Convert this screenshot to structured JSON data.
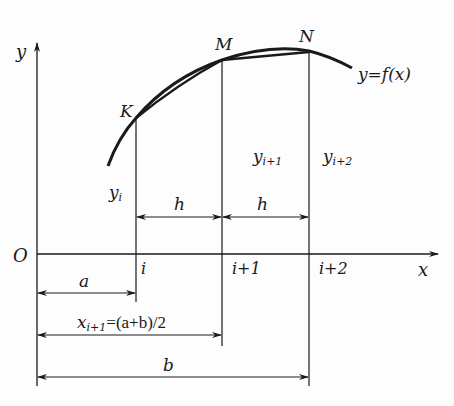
{
  "diagram": {
    "type": "numerical-integration-simpson-illustration",
    "axes": {
      "x_label": "x",
      "y_label": "y",
      "origin_label": "O"
    },
    "curve": {
      "label": "y=f(x)"
    },
    "points": [
      {
        "name": "K"
      },
      {
        "name": "M"
      },
      {
        "name": "N"
      }
    ],
    "ordinates": {
      "y_i": {
        "base": "y",
        "sub": "i"
      },
      "y_i1": {
        "base": "y",
        "sub": "i+1"
      },
      "y_i2": {
        "base": "y",
        "sub": "i+2"
      }
    },
    "ticks": {
      "i": "i",
      "i1": "i+1",
      "i2": "i+2"
    },
    "step_labels": {
      "h1": "h",
      "h2": "h"
    },
    "dimensions": {
      "a": "a",
      "mid": {
        "base": "x",
        "sub": "i+1",
        "rest": "=(a+b)/2"
      },
      "b": "b"
    },
    "colors": {
      "line": "#1a1a1a",
      "background": "#fdfdfd"
    }
  }
}
